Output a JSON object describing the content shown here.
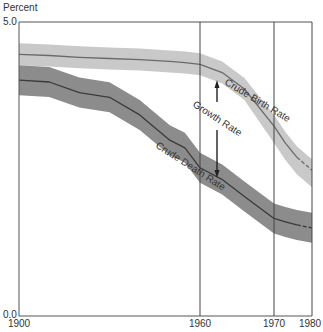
{
  "chart_data": {
    "type": "area",
    "title": "",
    "xlabel": "",
    "ylabel": "Percent",
    "ylim": [
      0.0,
      5.0
    ],
    "y_ticks": [
      "5.0",
      "0.0"
    ],
    "x_ticks": [
      "1900",
      "1960",
      "1970",
      "1980"
    ],
    "grid": false,
    "legend": "inline labels on curves",
    "annotations": [
      "Crude Birth Rate",
      "Growth Rate",
      "Crude Death Rate"
    ],
    "x": [
      1900,
      1910,
      1920,
      1930,
      1940,
      1950,
      1955,
      1960,
      1963,
      1966,
      1970,
      1973,
      1976,
      1980
    ],
    "series": [
      {
        "name": "Crude Birth Rate",
        "values": [
          4.45,
          4.43,
          4.4,
          4.38,
          4.36,
          4.33,
          4.31,
          4.28,
          4.14,
          3.86,
          3.23,
          2.94,
          2.7,
          2.48
        ],
        "band_color": "#c9c9c9",
        "line_color": "#6a6a6a"
      },
      {
        "name": "Crude Death Rate",
        "values": [
          4.01,
          3.98,
          3.8,
          3.72,
          3.42,
          2.99,
          2.86,
          2.52,
          2.32,
          2.03,
          1.66,
          1.6,
          1.55,
          1.5
        ],
        "band_color": "#8c8c8c",
        "line_color": "#3a3a3a"
      }
    ],
    "growth_rate_arrow": {
      "x": 1963,
      "from": 4.1,
      "to": 2.4
    }
  }
}
